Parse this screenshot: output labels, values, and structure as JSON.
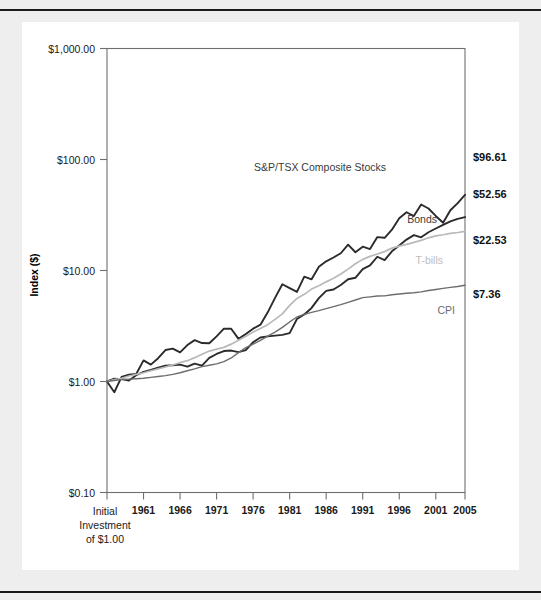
{
  "page": {
    "background": "#eeeeee",
    "panel_background": "#ffffff"
  },
  "chart_data": {
    "type": "line",
    "title": "",
    "subtitle": "",
    "xlabel": "",
    "ylabel": "Index ($)",
    "y_scale": "log",
    "ylim": [
      0.1,
      1000.0
    ],
    "xlim": [
      1956,
      2005
    ],
    "grid": false,
    "legend_position": "inline-right",
    "y_ticks": [
      "$0.10",
      "$1.00",
      "$10.00",
      "$100.00",
      "$1,000.00"
    ],
    "y_tick_values": [
      0.1,
      1.0,
      10.0,
      100.0,
      1000.0
    ],
    "x_ticks": [
      "Initial",
      "1961",
      "1966",
      "1971",
      "1976",
      "1981",
      "1986",
      "1991",
      "1996",
      "2001",
      "2005"
    ],
    "x_tick_values": [
      1956,
      1961,
      1966,
      1971,
      1976,
      1981,
      1986,
      1991,
      1996,
      2001,
      2005
    ],
    "x_origin_caption": [
      "Initial",
      "Investment",
      "of $1.00"
    ],
    "colors": {
      "stocks": "#2b2b2b",
      "bonds": "#2b2b2b",
      "tbills": "#b9b9b9",
      "cpi": "#6d6d6d",
      "axis": "#6f6f6f",
      "text": "#1a1a1a"
    },
    "series": [
      {
        "name": "S&P/TSX Composite Stocks",
        "label": "S&P/TSX Composite Stocks",
        "end_value_label": "$96.61",
        "end_value": 96.61,
        "color": "#2b2b2b",
        "width": 1.9,
        "x": [
          1956,
          1957,
          1958,
          1959,
          1960,
          1961,
          1962,
          1963,
          1964,
          1965,
          1966,
          1967,
          1968,
          1969,
          1970,
          1971,
          1972,
          1973,
          1974,
          1975,
          1976,
          1977,
          1978,
          1979,
          1980,
          1981,
          1982,
          1983,
          1984,
          1985,
          1986,
          1987,
          1988,
          1989,
          1990,
          1991,
          1992,
          1993,
          1994,
          1995,
          1996,
          1997,
          1998,
          1999,
          2000,
          2001,
          2002,
          2003,
          2004,
          2005
        ],
        "y": [
          1.0,
          0.8,
          1.1,
          1.15,
          1.17,
          1.55,
          1.42,
          1.62,
          1.92,
          1.98,
          1.83,
          2.13,
          2.36,
          2.22,
          2.21,
          2.55,
          2.99,
          2.99,
          2.42,
          2.68,
          2.99,
          3.25,
          4.2,
          5.66,
          7.52,
          6.93,
          6.41,
          8.8,
          8.33,
          10.8,
          12.1,
          13.1,
          14.3,
          17.1,
          14.6,
          16.4,
          15.6,
          20.0,
          19.7,
          23.3,
          29.5,
          33.5,
          30.9,
          39.3,
          36.2,
          31.0,
          26.9,
          34.9,
          40.4,
          48.1
        ]
      },
      {
        "name": "Bonds",
        "label": "Bonds",
        "end_value_label": "$52.56",
        "end_value": 52.56,
        "color": "#2b2b2b",
        "width": 1.9,
        "x": [
          1956,
          1957,
          1958,
          1959,
          1960,
          1961,
          1962,
          1963,
          1964,
          1965,
          1966,
          1967,
          1968,
          1969,
          1970,
          1971,
          1972,
          1973,
          1974,
          1975,
          1976,
          1977,
          1978,
          1979,
          1980,
          1981,
          1982,
          1983,
          1984,
          1985,
          1986,
          1987,
          1988,
          1989,
          1990,
          1991,
          1992,
          1993,
          1994,
          1995,
          1996,
          1997,
          1998,
          1999,
          2000,
          2001,
          2002,
          2003,
          2004,
          2005
        ],
        "y": [
          1.0,
          1.06,
          1.05,
          1.02,
          1.14,
          1.22,
          1.27,
          1.33,
          1.39,
          1.4,
          1.42,
          1.36,
          1.45,
          1.39,
          1.63,
          1.77,
          1.88,
          1.9,
          1.84,
          1.92,
          2.26,
          2.49,
          2.55,
          2.59,
          2.63,
          2.73,
          3.66,
          4.02,
          4.6,
          5.63,
          6.55,
          6.75,
          7.41,
          8.34,
          8.6,
          10.3,
          11.1,
          13.3,
          12.4,
          14.9,
          16.8,
          19.0,
          20.8,
          19.9,
          22.1,
          23.9,
          25.8,
          27.7,
          29.2,
          30.3
        ]
      },
      {
        "name": "T-bills",
        "label": "T-bills",
        "end_value_label": "$22.53",
        "end_value": 22.53,
        "color": "#b9b9b9",
        "width": 1.7,
        "x": [
          1956,
          1957,
          1958,
          1959,
          1960,
          1961,
          1962,
          1963,
          1964,
          1965,
          1966,
          1967,
          1968,
          1969,
          1970,
          1971,
          1972,
          1973,
          1974,
          1975,
          1976,
          1977,
          1978,
          1979,
          1980,
          1981,
          1982,
          1983,
          1984,
          1985,
          1986,
          1987,
          1988,
          1989,
          1990,
          1991,
          1992,
          1993,
          1994,
          1995,
          1996,
          1997,
          1998,
          1999,
          2000,
          2001,
          2002,
          2003,
          2004,
          2005
        ],
        "y": [
          1.0,
          1.04,
          1.07,
          1.12,
          1.16,
          1.2,
          1.25,
          1.3,
          1.35,
          1.41,
          1.48,
          1.54,
          1.64,
          1.76,
          1.88,
          1.96,
          2.03,
          2.17,
          2.35,
          2.55,
          2.79,
          3.0,
          3.25,
          3.63,
          4.07,
          4.85,
          5.6,
          6.1,
          6.8,
          7.3,
          7.9,
          8.5,
          9.3,
          10.3,
          11.5,
          12.6,
          13.4,
          14.1,
          14.8,
          15.9,
          16.6,
          17.2,
          17.9,
          18.7,
          19.7,
          20.5,
          21.0,
          21.6,
          22.0,
          22.53
        ]
      },
      {
        "name": "CPI",
        "label": "CPI",
        "end_value_label": "$7.36",
        "end_value": 7.36,
        "color": "#6d6d6d",
        "width": 1.4,
        "x": [
          1956,
          1957,
          1958,
          1959,
          1960,
          1961,
          1962,
          1963,
          1964,
          1965,
          1966,
          1967,
          1968,
          1969,
          1970,
          1971,
          1972,
          1973,
          1974,
          1975,
          1976,
          1977,
          1978,
          1979,
          1980,
          1981,
          1982,
          1983,
          1984,
          1985,
          1986,
          1987,
          1988,
          1989,
          1990,
          1991,
          1992,
          1993,
          1994,
          1995,
          1996,
          1997,
          1998,
          1999,
          2000,
          2001,
          2002,
          2003,
          2004,
          2005
        ],
        "y": [
          1.0,
          1.02,
          1.04,
          1.05,
          1.06,
          1.07,
          1.09,
          1.11,
          1.13,
          1.16,
          1.2,
          1.25,
          1.3,
          1.36,
          1.4,
          1.44,
          1.51,
          1.63,
          1.82,
          2.02,
          2.17,
          2.35,
          2.56,
          2.79,
          3.07,
          3.44,
          3.81,
          4.03,
          4.19,
          4.35,
          4.54,
          4.73,
          4.92,
          5.17,
          5.42,
          5.7,
          5.79,
          5.9,
          5.91,
          6.04,
          6.14,
          6.24,
          6.31,
          6.42,
          6.6,
          6.75,
          6.9,
          7.05,
          7.18,
          7.36
        ]
      }
    ],
    "annotations": [
      {
        "text": "S&P/TSX Composite Stocks",
        "series": "stocks"
      },
      {
        "text": "Bonds",
        "series": "bonds"
      },
      {
        "text": "T-bills",
        "series": "tbills"
      },
      {
        "text": "CPI",
        "series": "cpi"
      }
    ]
  }
}
